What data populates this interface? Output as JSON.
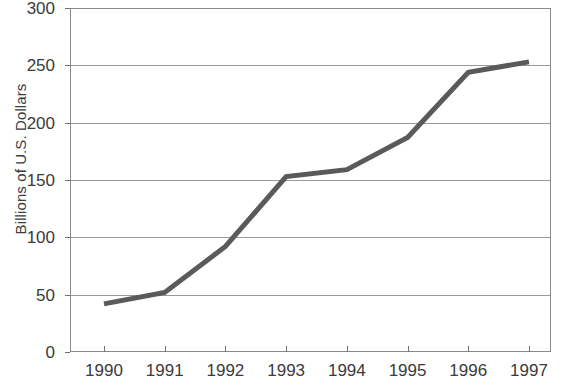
{
  "chart_data": {
    "type": "line",
    "title": "",
    "xlabel": "",
    "ylabel": "Billions of U.S. Dollars",
    "categories": [
      "1990",
      "1991",
      "1992",
      "1993",
      "1994",
      "1995",
      "1996",
      "1997"
    ],
    "x": [
      1990,
      1991,
      1992,
      1993,
      1994,
      1995,
      1996,
      1997
    ],
    "values": [
      42,
      52,
      92,
      153,
      159,
      187,
      244,
      253
    ],
    "series": [
      {
        "name": "Billions of U.S. Dollars",
        "values": [
          42,
          52,
          92,
          153,
          159,
          187,
          244,
          253
        ],
        "color": "#5a5a5a"
      }
    ],
    "ylim": [
      0,
      300
    ],
    "yticks": [
      0,
      50,
      100,
      150,
      200,
      250,
      300
    ],
    "ytick_labels": [
      "0",
      "50",
      "100",
      "150",
      "200",
      "250",
      "300"
    ],
    "xtick_labels": [
      "1990",
      "1991",
      "1992",
      "1993",
      "1994",
      "1995",
      "1996",
      "1997"
    ],
    "grid": true,
    "grid_axis": "y",
    "grid_color": "#9a9a9a",
    "legend": false,
    "legend_position": "none",
    "line_color": "#5a5a5a",
    "line_width": 5,
    "markers": false,
    "plot_border_color": "#8a8a8a",
    "background_color": "#ffffff"
  },
  "axes": {
    "y_title": "Billions of U.S. Dollars",
    "y_ticks": [
      {
        "label": "300",
        "value": 300
      },
      {
        "label": "250",
        "value": 250
      },
      {
        "label": "200",
        "value": 200
      },
      {
        "label": "150",
        "value": 150
      },
      {
        "label": "100",
        "value": 100
      },
      {
        "label": "50",
        "value": 50
      },
      {
        "label": "0",
        "value": 0
      }
    ],
    "x_ticks": [
      {
        "label": "1990",
        "value": 1990
      },
      {
        "label": "1991",
        "value": 1991
      },
      {
        "label": "1992",
        "value": 1992
      },
      {
        "label": "1993",
        "value": 1993
      },
      {
        "label": "1994",
        "value": 1994
      },
      {
        "label": "1995",
        "value": 1995
      },
      {
        "label": "1996",
        "value": 1996
      },
      {
        "label": "1997",
        "value": 1997
      }
    ]
  },
  "header": {
    "title": ""
  }
}
